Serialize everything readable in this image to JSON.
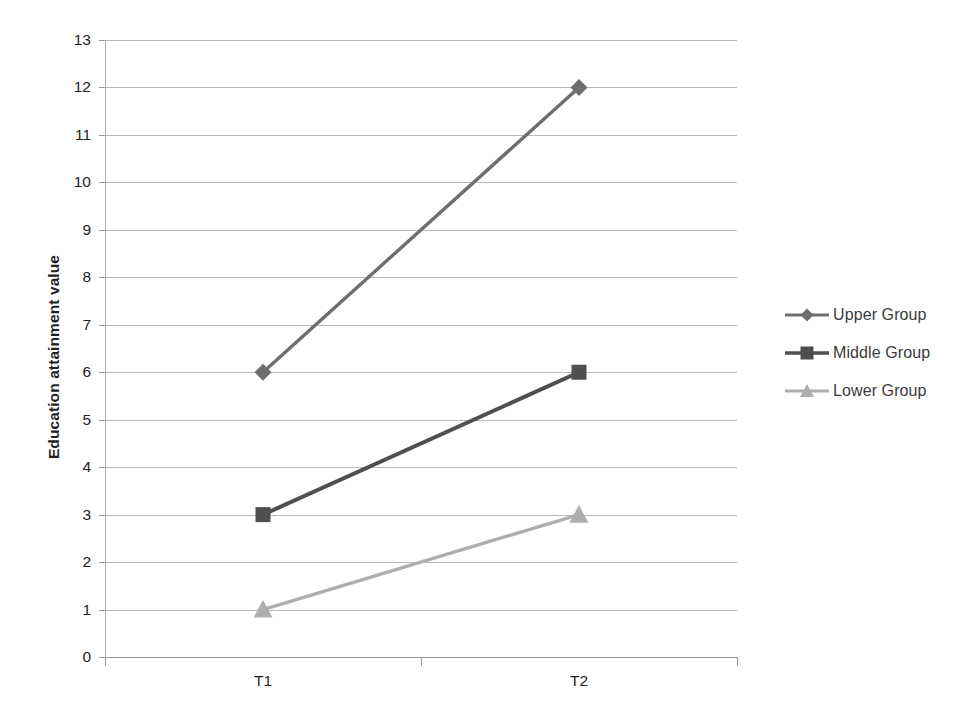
{
  "chart_data": {
    "type": "line",
    "title": "",
    "xlabel": "",
    "ylabel": "Education attainment value",
    "categories": [
      "T1",
      "T2"
    ],
    "ylim": [
      0,
      13
    ],
    "ytick_step": 1,
    "yticks": [
      13,
      12,
      11,
      10,
      9,
      8,
      7,
      6,
      5,
      4,
      3,
      2,
      1,
      0
    ],
    "grid": true,
    "legend_position": "right",
    "series": [
      {
        "name": "Upper Group",
        "values": [
          6,
          12
        ],
        "marker": "diamond",
        "color": "#6e6e6e"
      },
      {
        "name": "Middle Group",
        "values": [
          3,
          6
        ],
        "marker": "square",
        "color": "#4f4f4f"
      },
      {
        "name": "Lower Group",
        "values": [
          1,
          3
        ],
        "marker": "triangle",
        "color": "#aeaeae"
      }
    ]
  },
  "colors": {
    "upper_group": "#6e6e6e",
    "middle_group": "#4f4f4f",
    "lower_group": "#aeaeae",
    "gridline": "#b9b9b9",
    "axis": "#9a9a9a",
    "text": "#231f20",
    "legend_text": "#3a3a3a",
    "background": "#ffffff"
  }
}
